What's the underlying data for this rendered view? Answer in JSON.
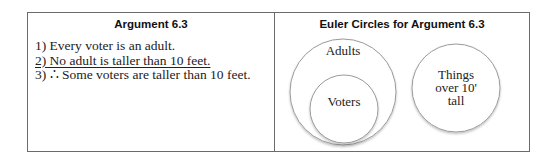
{
  "left_panel": {
    "title": "Argument 6.3",
    "premises": [
      {
        "number": "1)",
        "text": "Every voter is an adult.",
        "underlined": false
      },
      {
        "number": "2)",
        "text": "No adult is taller than 10 feet.",
        "underlined": true
      },
      {
        "number": "3)",
        "therefore_symbol": "∴",
        "text": "Some voters are taller than 10 feet.",
        "underlined": false
      }
    ],
    "line1": "1) Every voter is an adult.",
    "line2": "2) No adult is taller than 10 feet.",
    "line3": "3) ∴ Some voters are taller than 10 feet."
  },
  "right_panel": {
    "title": "Euler Circles for Argument 6.3",
    "circles": {
      "adults": {
        "label": "Adults"
      },
      "voters": {
        "label": "Voters"
      },
      "things": {
        "label_lines": [
          "Things",
          "over 10'",
          "tall"
        ]
      }
    }
  },
  "colors": {
    "border": "#6b6b6b",
    "circle_stroke": "#9a9a9a",
    "text": "#222222"
  }
}
